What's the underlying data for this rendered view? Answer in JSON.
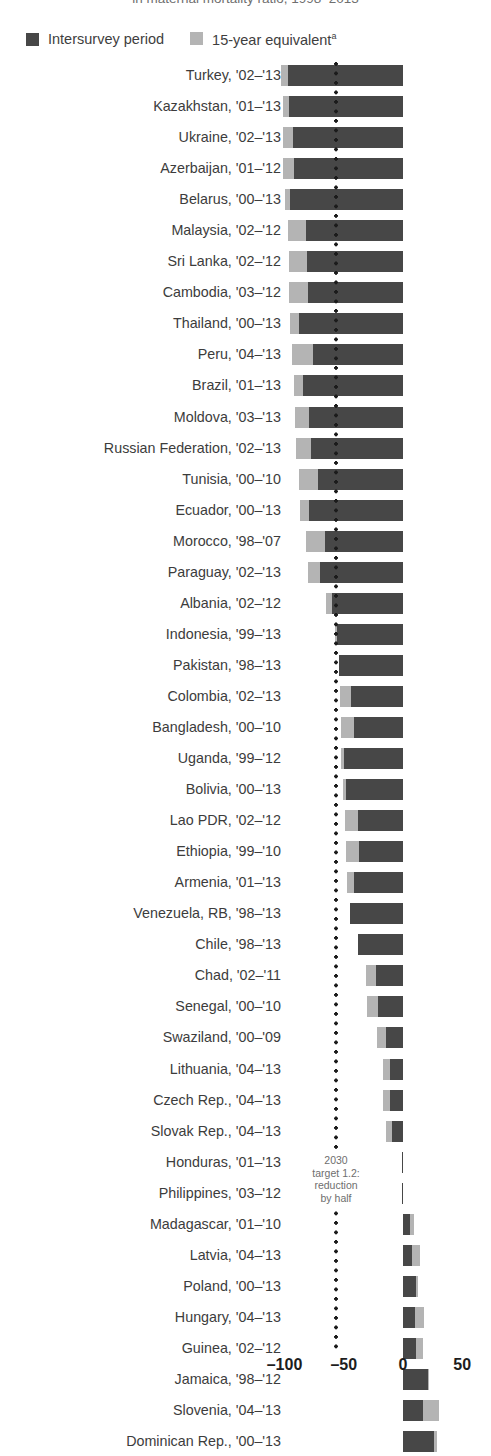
{
  "caption_cut": "in maternal mortality ratio, 1998–2013",
  "legend": {
    "items": [
      {
        "label": "Intersurvey period",
        "color": "#474747",
        "icon": "square-swatch-dark"
      },
      {
        "label": "15-year equivalent",
        "superscript": "a",
        "color": "#b4b4b4",
        "icon": "square-swatch-light"
      }
    ]
  },
  "annotation": {
    "line1": "2030",
    "line2": "target 1.2:",
    "line3": "reduction",
    "line4": "by half",
    "at_value": -50
  },
  "axis": {
    "ticks": [
      "–100",
      "–50",
      "0",
      "50"
    ],
    "tick_values": [
      -100,
      -50,
      0,
      50
    ]
  },
  "chart_data": {
    "type": "bar",
    "orientation": "horizontal",
    "title": "",
    "xlabel": "",
    "ylabel": "",
    "xlim": [
      -110,
      55
    ],
    "grid": false,
    "legend_position": "top-left",
    "series": [
      {
        "name": "Intersurvey period",
        "color": "#474747"
      },
      {
        "name": "15-year equivalent",
        "color": "#b4b4b4"
      }
    ],
    "note": "Each row shows two overlaid bars: the 15-year equivalent (light) is the longer/outer magnitude, the intersurvey period (dark) is drawn on top; values are percent change.",
    "rows": [
      {
        "label": "Turkey, '02–'13",
        "intersurvey": -97,
        "equivalent": -103
      },
      {
        "label": "Kazakhstan, '01–'13",
        "intersurvey": -96,
        "equivalent": -101
      },
      {
        "label": "Ukraine, '02–'13",
        "intersurvey": -93,
        "equivalent": -101
      },
      {
        "label": "Azerbaijan, '01–'12",
        "intersurvey": -92,
        "equivalent": -101
      },
      {
        "label": "Belarus, '00–'13",
        "intersurvey": -95,
        "equivalent": -100
      },
      {
        "label": "Malaysia, '02–'12",
        "intersurvey": -82,
        "equivalent": -97
      },
      {
        "label": "Sri Lanka, '02–'12",
        "intersurvey": -81,
        "equivalent": -96
      },
      {
        "label": "Cambodia, '03–'12",
        "intersurvey": -80,
        "equivalent": -96
      },
      {
        "label": "Thailand, '00–'13",
        "intersurvey": -88,
        "equivalent": -95
      },
      {
        "label": "Peru, '04–'13",
        "intersurvey": -76,
        "equivalent": -94
      },
      {
        "label": "Brazil, '01–'13",
        "intersurvey": -84,
        "equivalent": -92
      },
      {
        "label": "Moldova, '03–'13",
        "intersurvey": -79,
        "equivalent": -91
      },
      {
        "label": "Russian Federation, '02–'13",
        "intersurvey": -78,
        "equivalent": -90
      },
      {
        "label": "Tunisia, '00–'10",
        "intersurvey": -72,
        "equivalent": -88
      },
      {
        "label": "Ecuador, '00–'13",
        "intersurvey": -79,
        "equivalent": -87
      },
      {
        "label": "Morocco, '98–'07",
        "intersurvey": -66,
        "equivalent": -82
      },
      {
        "label": "Paraguay, '02–'13",
        "intersurvey": -70,
        "equivalent": -80
      },
      {
        "label": "Albania, '02–'12",
        "intersurvey": -60,
        "equivalent": -65
      },
      {
        "label": "Indonesia, '99–'13",
        "intersurvey": -56,
        "equivalent": -57
      },
      {
        "label": "Pakistan, '98–'13",
        "intersurvey": -54,
        "equivalent": -54
      },
      {
        "label": "Colombia, '02–'13",
        "intersurvey": -44,
        "equivalent": -53
      },
      {
        "label": "Bangladesh, '00–'10",
        "intersurvey": -41,
        "equivalent": -52
      },
      {
        "label": "Uganda, '99–'12",
        "intersurvey": -50,
        "equivalent": -52
      },
      {
        "label": "Bolivia, '00–'13",
        "intersurvey": -48,
        "equivalent": -51
      },
      {
        "label": "Lao PDR, '02–'12",
        "intersurvey": -38,
        "equivalent": -49
      },
      {
        "label": "Ethiopia, '99–'10",
        "intersurvey": -37,
        "equivalent": -48
      },
      {
        "label": "Armenia, '01–'13",
        "intersurvey": -41,
        "equivalent": -47
      },
      {
        "label": "Venezuela, RB, '98–'13",
        "intersurvey": -45,
        "equivalent": -45
      },
      {
        "label": "Chile, '98–'13",
        "intersurvey": -38,
        "equivalent": -38
      },
      {
        "label": "Chad, '02–'11",
        "intersurvey": -23,
        "equivalent": -31
      },
      {
        "label": "Senegal, '00–'10",
        "intersurvey": -21,
        "equivalent": -30
      },
      {
        "label": "Swaziland, '00–'09",
        "intersurvey": -14,
        "equivalent": -22
      },
      {
        "label": "Lithuania, '04–'13",
        "intersurvey": -11,
        "equivalent": -17
      },
      {
        "label": "Czech Rep., '04–'13",
        "intersurvey": -11,
        "equivalent": -17
      },
      {
        "label": "Slovak Rep., '04–'13",
        "intersurvey": -9,
        "equivalent": -14
      },
      {
        "label": "Honduras, '01–'13",
        "intersurvey": -1,
        "equivalent": -1
      },
      {
        "label": "Philippines, '03–'12",
        "intersurvey": -1,
        "equivalent": -1
      },
      {
        "label": "Madagascar, '01–'10",
        "intersurvey": 6,
        "equivalent": 9
      },
      {
        "label": "Latvia, '04–'13",
        "intersurvey": 8,
        "equivalent": 14
      },
      {
        "label": "Poland, '00–'13",
        "intersurvey": 11,
        "equivalent": 13
      },
      {
        "label": "Hungary, '04–'13",
        "intersurvey": 10,
        "equivalent": 18
      },
      {
        "label": "Guinea, '02–'12",
        "intersurvey": 11,
        "equivalent": 17
      },
      {
        "label": "Jamaica, '98–'12",
        "intersurvey": 21,
        "equivalent": 22
      },
      {
        "label": "Slovenia, '04–'13",
        "intersurvey": 17,
        "equivalent": 30
      },
      {
        "label": "Dominican Rep., '00–'13",
        "intersurvey": 26,
        "equivalent": 29
      }
    ]
  }
}
